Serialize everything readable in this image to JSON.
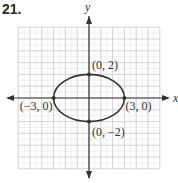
{
  "problem": {
    "number": "21."
  },
  "chart_data": {
    "type": "line",
    "title": "",
    "equation_implied": "x^2/9 + y^2/4 = 1",
    "xlabel": "x",
    "ylabel": "y",
    "xlim": [
      -6,
      6
    ],
    "ylim": [
      -6,
      6
    ],
    "grid": true,
    "grid_major_step": 1,
    "grid_minor_step": 0.5,
    "series": [
      {
        "name": "ellipse",
        "center": [
          0,
          0
        ],
        "a": 3,
        "b": 2
      }
    ],
    "points": [
      {
        "x": 0,
        "y": 2,
        "label": "(0, 2)"
      },
      {
        "x": 3,
        "y": 0,
        "label": "(3, 0)"
      },
      {
        "x": 0,
        "y": -2,
        "label": "(0, −2)"
      },
      {
        "x": -3,
        "y": 0,
        "label": "(−3, 0)"
      }
    ],
    "colors": {
      "curve": "#333333",
      "grid": "#c8c8c8",
      "axis": "#333333"
    }
  }
}
